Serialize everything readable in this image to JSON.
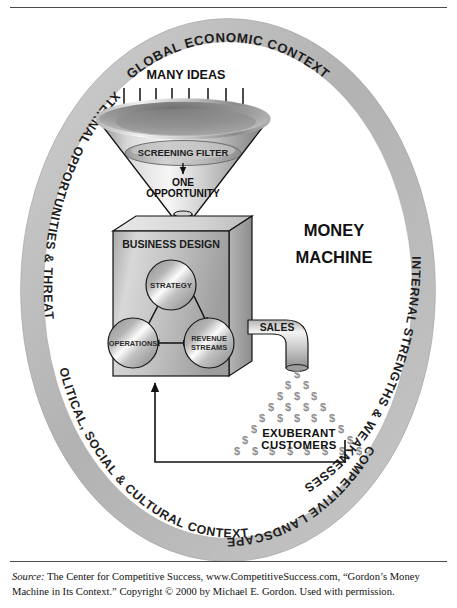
{
  "figure": {
    "center_label": {
      "line1": "MONEY",
      "line2": "MACHINE"
    },
    "ring": {
      "color": "#b6b6b6",
      "segments": [
        {
          "id": "global-economic-context",
          "label": "GLOBAL ECONOMIC CONTEXT",
          "position": "top"
        },
        {
          "id": "internal-strengths-weaknesses",
          "label": "INTERNAL STRENGTHS & WEAKNESSES",
          "position": "right"
        },
        {
          "id": "competitive-landscape",
          "label": "COMPETITIVE LANDSCAPE",
          "position": "bottom-right"
        },
        {
          "id": "political-social-cultural-contexts",
          "label": "POLITICAL, SOCIAL & CULTURAL CONTEXTS",
          "position": "bottom-left"
        },
        {
          "id": "external-opportunities-threats",
          "label": "EXTERNAL OPPORTUNITIES & THREATS",
          "position": "left"
        }
      ]
    },
    "funnel": {
      "input_label": "MANY IDEAS",
      "input_arrow_count": 8,
      "filter_label": "SCREENING FILTER",
      "output_label_line1": "ONE",
      "output_label_line2": "OPPORTUNITY"
    },
    "box": {
      "label": "BUSINESS DESIGN",
      "nodes": [
        {
          "id": "strategy",
          "label": "STRATEGY"
        },
        {
          "id": "operations",
          "label": "OPERATIONS"
        },
        {
          "id": "revenue-streams",
          "label_line1": "REVENUE",
          "label_line2": "STREAMS"
        }
      ]
    },
    "output": {
      "pipe_label": "SALES",
      "money_symbol": "$",
      "customers_line1": "EXUBERANT",
      "customers_line2": "CUSTOMERS",
      "feedback_loop": "reinvestment"
    },
    "colors": {
      "ring": "#b6b6b6",
      "metal_light": "#f2f2f2",
      "metal_mid": "#b9b9b9",
      "metal_dark": "#7d7d7d",
      "outline": "#1a1a1a",
      "money": "#8e8e8e"
    }
  },
  "caption": {
    "source_label": "Source:",
    "text": " The Center for Competitive Success, www.CompetitiveSuccess.com, “Gordon’s Money Machine in Its Context.” Copyright © 2000 by Michael E. Gordon. Used with permission."
  }
}
